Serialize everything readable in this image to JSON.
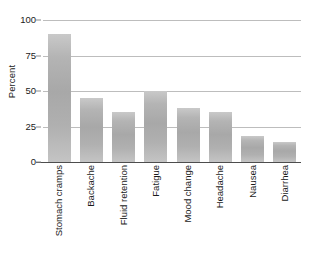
{
  "chart_data": {
    "type": "bar",
    "title": "",
    "subtitle": "",
    "xlabel": "",
    "ylabel": "Percent",
    "categories": [
      "Stomach cramps",
      "Backache",
      "Fluid retention",
      "Fatigue",
      "Mood change",
      "Headache",
      "Nausea",
      "Diarrhea"
    ],
    "values": [
      90,
      45,
      35,
      50,
      38,
      35,
      18,
      14
    ],
    "ylim": [
      0,
      100
    ],
    "yticks": [
      0,
      25,
      50,
      75,
      100
    ],
    "ytick_labels": [
      "0",
      "25",
      "50",
      "75",
      "100"
    ],
    "grid": true,
    "grid_axis": "y",
    "legend": false,
    "legend_position": "none",
    "bar_color": "#b0b0b0",
    "gridline_color": "#bdbdbd",
    "axis_color": "#4d4d4d",
    "background_color": "#ffffff",
    "text_color": "#1a1a1a",
    "xtick_label_rotation": 90
  }
}
